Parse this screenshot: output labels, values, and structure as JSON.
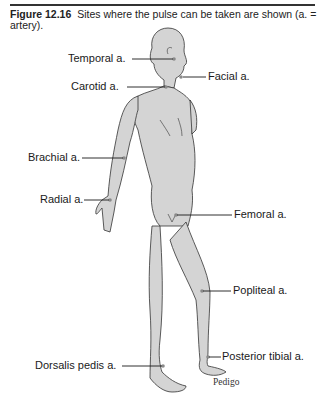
{
  "caption": {
    "figure_number": "Figure 12.16",
    "text": "Sites where the pulse can be taken are shown (a. = artery)."
  },
  "labels": {
    "temporal": "Temporal a.",
    "carotid": "Carotid a.",
    "facial": "Facial a.",
    "brachial": "Brachial a.",
    "radial": "Radial a.",
    "femoral": "Femoral a.",
    "popliteal": "Popliteal a.",
    "posterior_tibial": "Posterior tibial a.",
    "dorsalis_pedis": "Dorsalis pedis a."
  },
  "credit": "Pedigo",
  "colors": {
    "body_fill": "#d4d4d4",
    "outline": "#333333",
    "pulse_point": "#8a8a8a"
  }
}
